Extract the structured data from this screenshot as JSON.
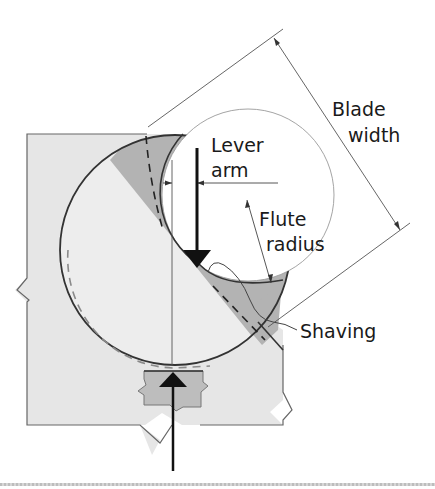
{
  "diagram": {
    "labels": {
      "blade_width_line1": "Blade",
      "blade_width_line2": "width",
      "lever_arm_line1": "Lever",
      "lever_arm_line2": "arm",
      "flute_radius_line1": "Flute",
      "flute_radius_line2": "radius",
      "shaving": "Shaving"
    },
    "colors": {
      "block_fill": "#e6e6e6",
      "shaded_fill": "#b3b3b3",
      "support_fill": "#bdbdbd",
      "outline": "#333333",
      "thin_line": "#555555",
      "dashed_grey": "#8a8a8a",
      "arrow": "#111111",
      "background": "#ffffff"
    }
  }
}
